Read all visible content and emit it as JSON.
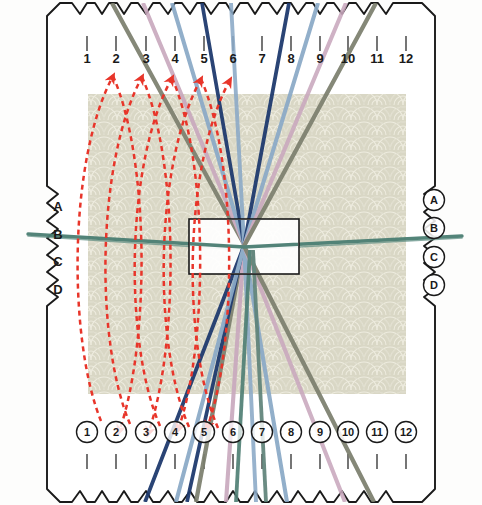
{
  "diagram": {
    "card": {
      "fill": "#ffffff",
      "stroke": "#1a1a1a",
      "corner_chamfer": 26
    },
    "fabric": {
      "fill": "#d8d6c4",
      "pattern": "scallop-fan-damask",
      "pattern_stroke": "#eceadd",
      "x": 88,
      "y": 94,
      "width": 318,
      "height": 300
    },
    "reed": {
      "x": 189,
      "y": 219,
      "width": 110,
      "height": 55,
      "fill": "#ffffff",
      "stroke": "#1a1a1a"
    },
    "convergence": {
      "x": 244,
      "y": 245
    }
  },
  "axes": {
    "top": {
      "labels": [
        "1",
        "2",
        "3",
        "4",
        "5",
        "6",
        "7",
        "8",
        "9",
        "10",
        "11",
        "12"
      ],
      "style": "plain",
      "y_text": 63,
      "x_positions": [
        87,
        116,
        146,
        175,
        204,
        233,
        262,
        291,
        320,
        348,
        377,
        406
      ]
    },
    "bottom": {
      "labels": [
        "1",
        "2",
        "3",
        "4",
        "5",
        "6",
        "7",
        "8",
        "9",
        "10",
        "11",
        "12"
      ],
      "style": "circled",
      "y_text": 436,
      "x_positions": [
        87,
        116,
        146,
        175,
        204,
        233,
        262,
        291,
        320,
        348,
        377,
        406
      ]
    },
    "left": {
      "labels": [
        "A",
        "B",
        "C",
        "D"
      ],
      "style": "plain",
      "x_text": 58,
      "y_positions": [
        211,
        239,
        266,
        294
      ]
    },
    "right": {
      "labels": [
        "A",
        "B",
        "C",
        "D"
      ],
      "style": "circled",
      "x_text": 434,
      "y_positions": [
        204,
        232,
        261,
        289
      ]
    }
  },
  "threads": {
    "palette": {
      "olive_gray": "#7c7f6e",
      "mauve": "#c8a7bd",
      "steel_blue": "#8aa9c6",
      "navy": "#1f3a6e",
      "teal": "#4f7f74",
      "slate_green": "#6f7f6a",
      "pale_blue": "#a9c0d8",
      "pink": "#cbaec3",
      "gray_green": "#8d9180"
    },
    "warp": [
      {
        "id": "w1",
        "color": "#7c7f6e",
        "top_x": 116,
        "bottom_x": 146,
        "width": 4.2
      },
      {
        "id": "w2",
        "color": "#c8a7bd",
        "top_x": 146,
        "bottom_x": 175,
        "width": 4.0
      },
      {
        "id": "w3",
        "color": "#8aa9c6",
        "top_x": 175,
        "bottom_x": 204,
        "width": 4.0
      },
      {
        "id": "w4",
        "color": "#1f3a6e",
        "top_x": 204,
        "bottom_x": 233,
        "width": 3.6
      },
      {
        "id": "w5",
        "color": "#4f7f74",
        "top_x": 233,
        "bottom_x": 262,
        "width": 3.6
      },
      {
        "id": "w6",
        "color": "#5e8278",
        "top_x": 262,
        "bottom_x": 233,
        "width": 3.6
      },
      {
        "id": "w7",
        "color": "#1f3a6e",
        "top_x": 291,
        "bottom_x": 291,
        "width": 3.6
      },
      {
        "id": "w8",
        "color": "#8aa9c6",
        "top_x": 320,
        "bottom_x": 320,
        "width": 4.0
      },
      {
        "id": "w9",
        "color": "#c8a7bd",
        "top_x": 348,
        "bottom_x": 348,
        "width": 4.0
      },
      {
        "id": "w10",
        "color": "#7c7f6e",
        "top_x": 377,
        "bottom_x": 377,
        "width": 4.2
      }
    ],
    "weft": {
      "color": "#4a7d72",
      "width": 3.4,
      "left_y": 235,
      "center_y": 248,
      "right_y": 236
    }
  },
  "annotations": {
    "arrow_color": "#e8352a",
    "dash_pattern": "5 4",
    "top_arrow_count": 5,
    "bottom_arrow_count": 4,
    "curve_count": 7,
    "description": "Red dashed arcs with arrowheads indicate warp shift direction"
  }
}
